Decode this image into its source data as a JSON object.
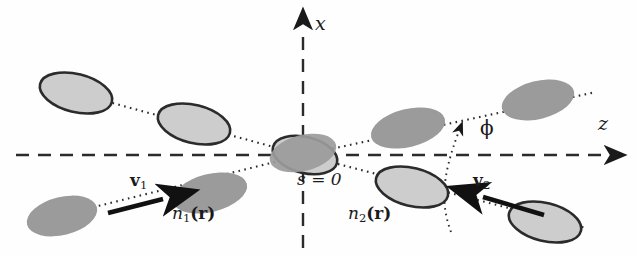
{
  "figure": {
    "kind": "beam-crossing-geometry-diagram",
    "background_color": "#fefefe",
    "ink_color": "#1a1a1a",
    "ellipse_fill_light": "#cdcdcd",
    "ellipse_fill_dark": "#9a9a9a",
    "ellipse_stroke": "#2b2b2b"
  },
  "axes": {
    "x_label": "x",
    "z_label": "z",
    "style": "dashed",
    "origin_label": "s = 0"
  },
  "angle": {
    "label": "ϕ"
  },
  "beams": [
    {
      "id": "beam-1",
      "velocity_label_vec": "v",
      "velocity_label_sub": "1",
      "density_label_n": "n",
      "density_label_sub": "1",
      "density_label_arg": "(r)",
      "direction": "incoming-from-lower-left"
    },
    {
      "id": "beam-2",
      "velocity_label_vec": "v",
      "velocity_label_sub": "2",
      "density_label_n": "n",
      "density_label_sub": "2",
      "density_label_arg": "(r)",
      "direction": "incoming-from-lower-right"
    }
  ],
  "labels": {
    "x_axis": "x",
    "z_axis": "z",
    "origin": "s = 0",
    "phi": "ϕ",
    "v1_base": "v",
    "v1_sub": "1",
    "v2_base": "v",
    "v2_sub": "2",
    "n1_base": "n",
    "n1_sub": "1",
    "n1_arg": "(r)",
    "n2_base": "n",
    "n2_sub": "2",
    "n2_arg": "(r)"
  }
}
